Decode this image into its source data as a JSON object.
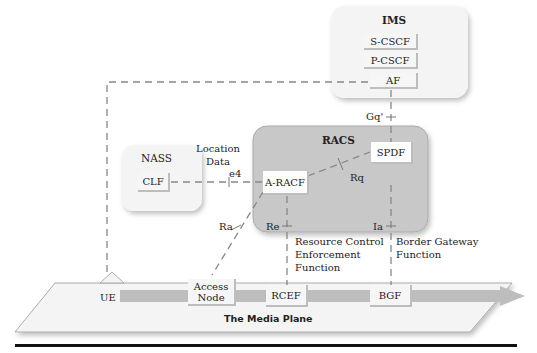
{
  "diagram": {
    "groups": {
      "ims": {
        "label": "IMS",
        "nodes": [
          "S-CSCF",
          "P-CSCF",
          "AF"
        ]
      },
      "racs": {
        "label": "RACS",
        "nodes": [
          "SPDF",
          "A-RACF"
        ]
      },
      "nass": {
        "label": "NASS",
        "nodes": [
          "CLF"
        ]
      },
      "media_plane": {
        "label": "The Media Plane",
        "nodes": [
          "UE",
          "Access Node",
          "RCEF",
          "BGF"
        ]
      }
    },
    "nodes": {
      "s_cscf": "S-CSCF",
      "p_cscf": "P-CSCF",
      "af": "AF",
      "spdf": "SPDF",
      "a_racf": "A-RACF",
      "clf": "CLF",
      "ue": "UE",
      "access_node_line1": "Access",
      "access_node_line2": "Node",
      "rcef": "RCEF",
      "bgf": "BGF"
    },
    "interfaces": {
      "gq": "Gq'",
      "e4": "e4",
      "rq": "Rq",
      "ra": "Ra",
      "re": "Re",
      "ia": "Ia"
    },
    "annotations": {
      "location_data_line1": "Location",
      "location_data_line2": "Data",
      "rcef_desc_line1": "Resource Control",
      "rcef_desc_line2": "Enforcement",
      "rcef_desc_line3": "Function",
      "bgf_desc_line1": "Border Gateway",
      "bgf_desc_line2": "Function"
    },
    "colors": {
      "racs_fill": "#c8c8c8",
      "group_fill": "#f4f4f4",
      "line": "#888888"
    }
  }
}
